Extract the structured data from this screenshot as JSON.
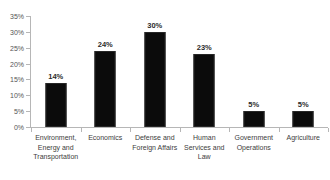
{
  "chart_data": {
    "type": "bar",
    "title": "",
    "xlabel": "",
    "ylabel": "",
    "ylim": [
      0,
      35
    ],
    "grid": false,
    "legend": false,
    "value_suffix": "%",
    "categories": [
      "Environment, Energy and Transportation",
      "Economics",
      "Defense and Foreign Affairs",
      "Human Services and Law",
      "Government Operations",
      "Agriculture"
    ],
    "values": [
      14,
      24,
      30,
      23,
      5,
      5
    ],
    "value_labels": [
      "14%",
      "24%",
      "30%",
      "23%",
      "5%",
      "5%"
    ],
    "ytick_labels": [
      "35%",
      "30%",
      "25%",
      "20%",
      "15%",
      "10%",
      "5%",
      "0%"
    ],
    "ytick_values": [
      35,
      30,
      25,
      20,
      15,
      10,
      5,
      0
    ],
    "bar_color": "#0b0b0b",
    "axis_color": "#b6b6b6",
    "text_color": "#3d3d3d"
  }
}
